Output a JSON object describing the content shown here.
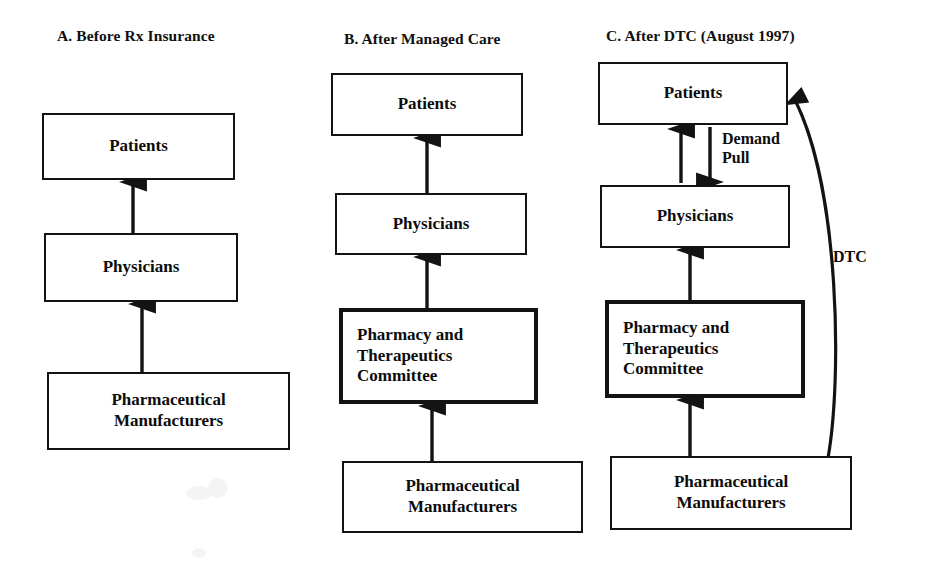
{
  "figure": {
    "background_color": "#ffffff",
    "line_color": "#131313",
    "text_color": "#0c0c0c"
  },
  "panels": [
    {
      "id": "a",
      "title": "A. Before Rx Insurance",
      "title_x": 57,
      "title_y": 27,
      "nodes": [
        {
          "id": "a-patients",
          "label": "Patients",
          "x": 42,
          "y": 113,
          "w": 193,
          "h": 67,
          "thick": false,
          "align": "center"
        },
        {
          "id": "a-physicians",
          "label": "Physicians",
          "x": 44,
          "y": 233,
          "w": 194,
          "h": 69,
          "thick": false,
          "align": "center"
        },
        {
          "id": "a-manufacturers",
          "label": "Pharmaceutical\nManufacturers",
          "x": 47,
          "y": 372,
          "w": 243,
          "h": 78,
          "thick": false,
          "align": "center"
        }
      ],
      "arrows": [
        {
          "id": "a-physicians-to-patients",
          "x1": 133,
          "y1": 233,
          "x2": 133,
          "y2": 182,
          "direction": "up"
        },
        {
          "id": "a-manufacturers-to-physicians",
          "x1": 142,
          "y1": 372,
          "x2": 142,
          "y2": 304,
          "direction": "up"
        }
      ],
      "edge_labels": []
    },
    {
      "id": "b",
      "title": "B. After Managed Care",
      "title_x": 344,
      "title_y": 30,
      "nodes": [
        {
          "id": "b-patients",
          "label": "Patients",
          "x": 331,
          "y": 73,
          "w": 192,
          "h": 63,
          "thick": false,
          "align": "center"
        },
        {
          "id": "b-physicians",
          "label": "Physicians",
          "x": 335,
          "y": 193,
          "w": 192,
          "h": 62,
          "thick": false,
          "align": "center"
        },
        {
          "id": "b-pt-committee",
          "label": "Pharmacy and\nTherapeutics\nCommittee",
          "x": 339,
          "y": 308,
          "w": 199,
          "h": 96,
          "thick": true,
          "align": "left"
        },
        {
          "id": "b-manufacturers",
          "label": "Pharmaceutical\nManufacturers",
          "x": 342,
          "y": 461,
          "w": 241,
          "h": 72,
          "thick": false,
          "align": "center"
        }
      ],
      "arrows": [
        {
          "id": "b-physicians-to-patients",
          "x1": 427,
          "y1": 193,
          "x2": 427,
          "y2": 138,
          "direction": "up"
        },
        {
          "id": "b-committee-to-physicians",
          "x1": 427,
          "y1": 308,
          "x2": 427,
          "y2": 257,
          "direction": "up"
        },
        {
          "id": "b-manufacturers-to-committee",
          "x1": 432,
          "y1": 461,
          "x2": 432,
          "y2": 406,
          "direction": "up"
        }
      ],
      "edge_labels": []
    },
    {
      "id": "c",
      "title": "C. After DTC (August 1997)",
      "title_x": 606,
      "title_y": 27,
      "nodes": [
        {
          "id": "c-patients",
          "label": "Patients",
          "x": 598,
          "y": 62,
          "w": 190,
          "h": 63,
          "thick": false,
          "align": "center"
        },
        {
          "id": "c-physicians",
          "label": "Physicians",
          "x": 600,
          "y": 185,
          "w": 190,
          "h": 63,
          "thick": false,
          "align": "center"
        },
        {
          "id": "c-pt-committee",
          "label": "Pharmacy and\nTherapeutics\nCommittee",
          "x": 605,
          "y": 300,
          "w": 200,
          "h": 98,
          "thick": true,
          "align": "left"
        },
        {
          "id": "c-manufacturers",
          "label": "Pharmaceutical\nManufacturers",
          "x": 610,
          "y": 456,
          "w": 242,
          "h": 74,
          "thick": false,
          "align": "center"
        }
      ],
      "arrows": [
        {
          "id": "c-physicians-to-patients",
          "x1": 681,
          "y1": 183,
          "x2": 681,
          "y2": 129,
          "direction": "up"
        },
        {
          "id": "c-patients-to-physicians",
          "x1": 710,
          "y1": 127,
          "x2": 710,
          "y2": 182,
          "direction": "down"
        },
        {
          "id": "c-committee-to-physicians",
          "x1": 690,
          "y1": 300,
          "x2": 690,
          "y2": 250,
          "direction": "up"
        },
        {
          "id": "c-manufacturers-to-committee",
          "x1": 690,
          "y1": 456,
          "x2": 690,
          "y2": 400,
          "direction": "up"
        }
      ],
      "curved_arrows": [
        {
          "id": "c-dtc-curve",
          "from": "c-manufacturers",
          "to": "c-patients",
          "path": "M 828 458 C 842 380 840 190 795 100",
          "direction": "up"
        }
      ],
      "edge_labels": [
        {
          "id": "c-demand-pull-label",
          "text": "Demand\nPull",
          "x": 722,
          "y": 130
        },
        {
          "id": "c-dtc-label",
          "text": "DTC",
          "x": 833,
          "y": 248
        }
      ]
    }
  ]
}
